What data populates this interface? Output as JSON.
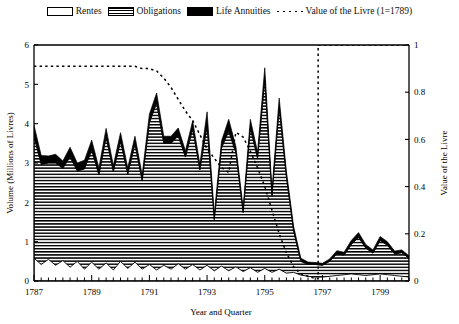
{
  "legend": {
    "items": [
      {
        "label": "Rentes",
        "swatch": "white-box-icon"
      },
      {
        "label": "Obligations",
        "swatch": "hatched-box-icon"
      },
      {
        "label": "Life Annuities",
        "swatch": "black-box-icon"
      },
      {
        "label": "Value of the Livre (1=1789)",
        "swatch": "dashed-line-icon"
      }
    ]
  },
  "chart_data": {
    "type": "area",
    "title": "",
    "xlabel": "Year and Quarter",
    "ylabel": "Volume (Millions of Livres)",
    "y2label": "Value of the Livre",
    "xlim": [
      1787.0,
      1800.0
    ],
    "ylim": [
      0,
      6
    ],
    "y2lim": [
      0,
      1
    ],
    "yticks": [
      0,
      1,
      2,
      3,
      4,
      5,
      6
    ],
    "ytick_labels": [
      "0",
      "1",
      "2",
      "3",
      "4",
      "5",
      "6"
    ],
    "y2ticks": [
      0,
      0.2,
      0.4,
      0.6,
      0.8,
      1
    ],
    "y2tick_labels": [
      "0",
      "0.2",
      "0.4",
      "0.6",
      "0.8",
      "1"
    ],
    "xticks_major": [
      1787,
      1789,
      1791,
      1793,
      1795,
      1797,
      1799
    ],
    "xtick_labels": [
      "1787",
      "1789",
      "1791",
      "1793",
      "1795",
      "1797",
      "1799"
    ],
    "xtick_minor_step": 0.25,
    "grid": false,
    "legend_position": "top-center",
    "stacked": true,
    "x": [
      1787.0,
      1787.25,
      1787.5,
      1787.75,
      1788.0,
      1788.25,
      1788.5,
      1788.75,
      1789.0,
      1789.25,
      1789.5,
      1789.75,
      1790.0,
      1790.25,
      1790.5,
      1790.75,
      1791.0,
      1791.25,
      1791.5,
      1791.75,
      1792.0,
      1792.25,
      1792.5,
      1792.75,
      1793.0,
      1793.25,
      1793.5,
      1793.75,
      1794.0,
      1794.25,
      1794.5,
      1794.75,
      1795.0,
      1795.25,
      1795.5,
      1795.75,
      1796.0,
      1796.25,
      1796.5,
      1796.75,
      1797.0,
      1797.25,
      1797.5,
      1797.75,
      1798.0,
      1798.25,
      1798.5,
      1798.75,
      1799.0,
      1799.25,
      1799.5,
      1799.75,
      1800.0
    ],
    "series": [
      {
        "name": "Rentes",
        "fill": "white",
        "values": [
          0.58,
          0.42,
          0.55,
          0.4,
          0.52,
          0.35,
          0.5,
          0.3,
          0.48,
          0.3,
          0.46,
          0.28,
          0.5,
          0.32,
          0.48,
          0.3,
          0.42,
          0.28,
          0.4,
          0.3,
          0.44,
          0.3,
          0.42,
          0.28,
          0.4,
          0.26,
          0.38,
          0.26,
          0.36,
          0.24,
          0.34,
          0.22,
          0.32,
          0.22,
          0.3,
          0.2,
          0.22,
          0.15,
          0.12,
          0.1,
          0.1,
          0.12,
          0.14,
          0.16,
          0.18,
          0.16,
          0.14,
          0.16,
          0.18,
          0.16,
          0.14,
          0.12,
          0.1
        ]
      },
      {
        "name": "Obligations",
        "fill": "hatched",
        "values": [
          3.1,
          2.55,
          2.45,
          2.6,
          2.35,
          2.8,
          2.3,
          2.55,
          2.85,
          2.4,
          3.2,
          2.5,
          3.05,
          2.4,
          3.0,
          2.25,
          3.6,
          4.25,
          3.1,
          3.2,
          3.25,
          2.85,
          3.45,
          2.55,
          3.55,
          1.3,
          3.0,
          3.55,
          2.9,
          1.5,
          3.55,
          2.9,
          4.8,
          1.95,
          4.1,
          2.45,
          1.05,
          0.35,
          0.3,
          0.32,
          0.3,
          0.38,
          0.55,
          0.5,
          0.75,
          0.95,
          0.7,
          0.55,
          0.85,
          0.75,
          0.55,
          0.6,
          0.48
        ]
      },
      {
        "name": "Life Annuities",
        "fill": "black",
        "values": [
          0.28,
          0.22,
          0.18,
          0.22,
          0.18,
          0.25,
          0.2,
          0.22,
          0.25,
          0.18,
          0.22,
          0.16,
          0.22,
          0.16,
          0.2,
          0.15,
          0.22,
          0.25,
          0.18,
          0.18,
          0.2,
          0.16,
          0.2,
          0.14,
          0.35,
          0.14,
          0.18,
          0.3,
          0.16,
          0.12,
          0.22,
          0.16,
          0.3,
          0.14,
          0.25,
          0.14,
          0.12,
          0.08,
          0.06,
          0.05,
          0.05,
          0.06,
          0.08,
          0.07,
          0.1,
          0.12,
          0.09,
          0.08,
          0.1,
          0.09,
          0.07,
          0.07,
          0.06
        ]
      }
    ],
    "line_series": {
      "name": "Value of the Livre (1=1789)",
      "axis": "right",
      "style": "dotted",
      "x": [
        1787.0,
        1787.25,
        1787.5,
        1787.75,
        1788.0,
        1788.25,
        1788.5,
        1788.75,
        1789.0,
        1789.25,
        1789.5,
        1789.75,
        1790.0,
        1790.25,
        1790.5,
        1790.75,
        1791.0,
        1791.25,
        1791.5,
        1791.75,
        1792.0,
        1792.25,
        1792.5,
        1792.75,
        1793.0,
        1793.25,
        1793.5,
        1793.75,
        1794.0,
        1794.25,
        1794.5,
        1794.75,
        1795.0,
        1795.25,
        1795.5,
        1795.75,
        1796.0,
        1796.25,
        1796.5,
        1796.75,
        1796.85,
        1796.85,
        1797.0,
        1797.5,
        1798.0,
        1798.5,
        1799.0,
        1799.5,
        1800.0
      ],
      "values": [
        0.91,
        0.91,
        0.91,
        0.91,
        0.91,
        0.91,
        0.91,
        0.91,
        0.91,
        0.91,
        0.91,
        0.91,
        0.91,
        0.91,
        0.91,
        0.9,
        0.9,
        0.89,
        0.86,
        0.82,
        0.77,
        0.72,
        0.68,
        0.62,
        0.56,
        0.52,
        0.48,
        0.46,
        0.63,
        0.61,
        0.55,
        0.48,
        0.4,
        0.3,
        0.2,
        0.12,
        0.06,
        0.03,
        0.02,
        0.01,
        0.01,
        1.0,
        1.0,
        1.0,
        1.0,
        1.0,
        1.0,
        1.0,
        1.0
      ]
    }
  }
}
